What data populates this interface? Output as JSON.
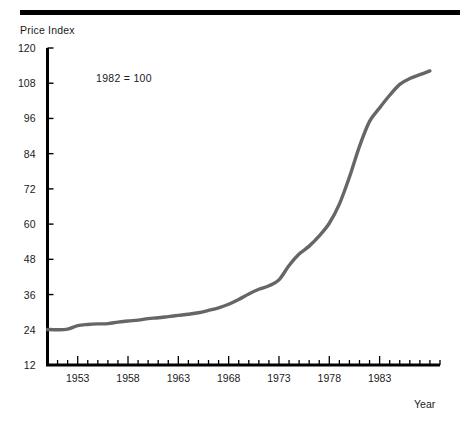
{
  "chart_data": {
    "type": "line",
    "title": "",
    "xlabel": "Year",
    "ylabel": "Price Index",
    "annotation": "1982 = 100",
    "xlim": [
      1950,
      1989
    ],
    "ylim": [
      12,
      120
    ],
    "yticks": [
      12,
      24,
      36,
      48,
      60,
      72,
      84,
      96,
      108,
      120
    ],
    "xticks": [
      1953,
      1958,
      1963,
      1968,
      1973,
      1978,
      1983
    ],
    "x_minor_tick_step": 1,
    "grid": false,
    "legend": "none",
    "line_color": "#666666",
    "series": [
      {
        "name": "Price Index",
        "x": [
          1950,
          1951,
          1952,
          1953,
          1954,
          1955,
          1956,
          1957,
          1958,
          1959,
          1960,
          1961,
          1962,
          1963,
          1964,
          1965,
          1966,
          1967,
          1968,
          1969,
          1970,
          1971,
          1972,
          1973,
          1974,
          1975,
          1976,
          1977,
          1978,
          1979,
          1980,
          1981,
          1982,
          1983,
          1984,
          1985,
          1986,
          1987,
          1988
        ],
        "values": [
          24.1,
          24.0,
          24.2,
          25.4,
          25.8,
          26.0,
          26.1,
          26.6,
          27.0,
          27.3,
          27.8,
          28.1,
          28.5,
          28.9,
          29.3,
          29.8,
          30.6,
          31.5,
          32.7,
          34.3,
          36.2,
          37.8,
          39.0,
          41.0,
          45.9,
          49.8,
          52.5,
          56.0,
          60.3,
          66.8,
          76.0,
          86.5,
          95.0,
          99.6,
          103.9,
          107.6,
          109.6,
          110.9,
          112.2
        ]
      }
    ]
  },
  "labels": {
    "y_axis_title": "Price Index",
    "x_axis_title": "Year",
    "annotation": "1982 = 100"
  }
}
